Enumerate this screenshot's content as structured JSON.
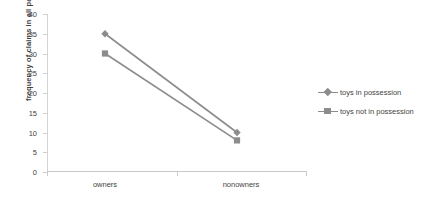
{
  "chart_data": {
    "type": "line",
    "title": "",
    "xlabel": "",
    "ylabel": "frequency of claims in all pairs",
    "categories": [
      "owners",
      "nonowners"
    ],
    "yticks": [
      0,
      5,
      10,
      15,
      20,
      25,
      30,
      35,
      40
    ],
    "ylim": [
      0,
      40
    ],
    "grid": false,
    "legend_position": "right",
    "series": [
      {
        "name": "toys in possession",
        "values": [
          35,
          10
        ],
        "color": "#8c8c8c",
        "marker": "diamond"
      },
      {
        "name": "toys not in possession",
        "values": [
          30,
          8
        ],
        "color": "#8c8c8c",
        "marker": "square"
      }
    ]
  },
  "axis": {
    "y_title": "frequency of claims in all pairs",
    "y_tick_labels": [
      "40",
      "35",
      "30",
      "25",
      "20",
      "15",
      "10",
      "5",
      "0"
    ],
    "x_tick_labels": [
      "owners",
      "nonowners"
    ]
  },
  "legend": {
    "items": [
      {
        "label": "toys in possession",
        "marker": "diamond-marker-icon"
      },
      {
        "label": "toys not in possession",
        "marker": "square-marker-icon"
      }
    ]
  },
  "colors": {
    "series": "#8c8c8c",
    "axis": "#c9c9c9",
    "text": "#3f3f3f",
    "background": "#ffffff"
  }
}
